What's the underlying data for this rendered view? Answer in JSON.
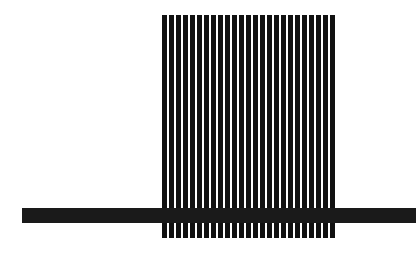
{
  "figure": {
    "background": "#ffffff",
    "stripe_block": {
      "left": 162,
      "top": 15,
      "width": 176,
      "height": 223,
      "bar_count": 25,
      "bar_width": 5,
      "period": 7,
      "bar_color": "#111111"
    },
    "horizontal_band": {
      "left": 22,
      "top": 208,
      "width": 394,
      "height": 15,
      "color": "#1a1a1a"
    }
  }
}
